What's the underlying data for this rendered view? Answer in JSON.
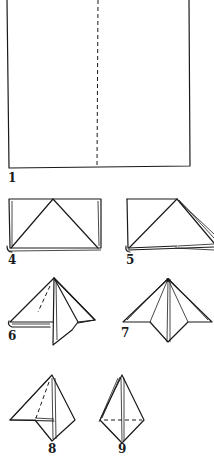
{
  "diagram": {
    "type": "origami-napkin-folding-steps",
    "steps": [
      {
        "number": "1",
        "description": "Square with vertical dashed center fold line"
      },
      {
        "number": "4",
        "description": "Folded rectangle with triangle fold lines"
      },
      {
        "number": "5",
        "description": "Right corner folded down"
      },
      {
        "number": "6",
        "description": "Pyramid form with left flap, dashed fold line"
      },
      {
        "number": "7",
        "description": "Symmetric pyramid with both flaps"
      },
      {
        "number": "8",
        "description": "Left flap folded, dashed line"
      },
      {
        "number": "9",
        "description": "Narrow diamond shape with horizontal dashed line"
      }
    ]
  },
  "labels": {
    "step1": "1",
    "step4": "4",
    "step5": "5",
    "step6": "6",
    "step7": "7",
    "step8": "8",
    "step9": "9"
  },
  "colors": {
    "ink": "#1a1a1a",
    "background": "#ffffff"
  }
}
